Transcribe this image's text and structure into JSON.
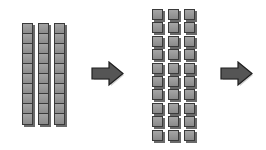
{
  "diagram": {
    "stages": [
      {
        "name": "ten-rods",
        "count": 3,
        "units_per_rod": 10
      },
      {
        "name": "unit-cubes",
        "columns": 3,
        "rows": 10,
        "total": 30
      }
    ],
    "arrows": 2,
    "colors": {
      "block_fill": "#999999",
      "block_edge": "#3a3a3a",
      "arrow_fill": "#555555",
      "background": "#ffffff"
    }
  }
}
